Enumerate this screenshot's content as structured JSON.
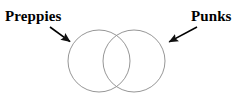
{
  "diagram": {
    "type": "venn",
    "title": "",
    "background_color": "#ffffff",
    "labels": [
      {
        "id": "preppies",
        "text": "Preppies",
        "position": "top-left",
        "color": "#000000",
        "points_to": "left-circle"
      },
      {
        "id": "punks",
        "text": "Punks",
        "position": "top-right",
        "color": "#000000",
        "points_to": "right-circle"
      }
    ],
    "circles": [
      {
        "id": "left-circle",
        "name": "Preppies set",
        "cx": 99,
        "cy": 61,
        "r": 31,
        "stroke_color": "#8a8a8a",
        "fill_color": "none"
      },
      {
        "id": "right-circle",
        "name": "Punks set",
        "cx": 134,
        "cy": 61,
        "r": 31,
        "stroke_color": "#8a8a8a",
        "fill_color": "none"
      }
    ],
    "arrows": [
      {
        "id": "left-arrow",
        "from_x": 50,
        "from_y": 27,
        "to_x": 72,
        "to_y": 43,
        "color": "#000000",
        "direction": "down-right"
      },
      {
        "id": "right-arrow",
        "from_x": 197,
        "from_y": 27,
        "to_x": 167,
        "to_y": 43,
        "color": "#000000",
        "direction": "down-left"
      }
    ],
    "intersection": {
      "label": "",
      "description": "overlap region between the two circles"
    }
  }
}
